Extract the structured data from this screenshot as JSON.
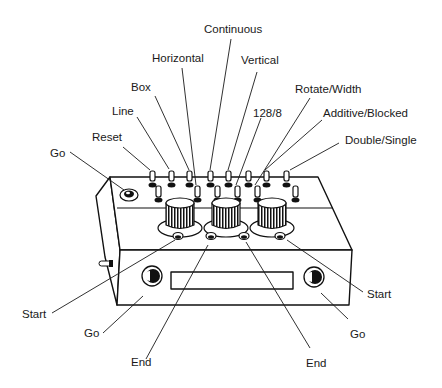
{
  "diagram": {
    "labels": {
      "continuous": "Continuous",
      "horizontal": "Horizontal",
      "vertical": "Vertical",
      "box": "Box",
      "rotate_width": "Rotate/Width",
      "line": "Line",
      "n128_8": "128/8",
      "additive_blocked": "Additive/Blocked",
      "reset": "Reset",
      "double_single": "Double/Single",
      "go_top": "Go",
      "start_left": "Start",
      "start_right": "Start",
      "go_left": "Go",
      "go_right": "Go",
      "end_left": "End",
      "end_right": "End"
    },
    "colors": {
      "ink": "#1a1a1a",
      "background": "#ffffff"
    }
  }
}
